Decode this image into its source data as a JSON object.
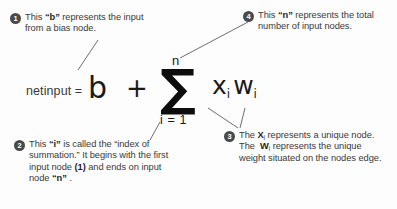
{
  "diagram": {
    "background_color": "#fdfdfd",
    "text_color": "#3a3a3a",
    "badge_color": "#4a4a4a",
    "formula": {
      "lhs": "netinput =",
      "bias_term": "b",
      "operator": "+",
      "sigma_symbol": "∑",
      "sigma_upper_limit": "n",
      "sigma_lower_limit": "i = 1",
      "summand_x": "x",
      "summand_x_sub": "i",
      "summand_w": "w",
      "summand_w_sub": "i"
    },
    "annotations": [
      {
        "number": "1",
        "line1": "This “b” represents the",
        "line2": "input from a bias node.",
        "target": "bias-term"
      },
      {
        "number": "2",
        "line1": "This “i” is called the “index",
        "line2": "of summation.”  It begins",
        "line3": "with the first input node",
        "line4": "(1) and ends on input",
        "line5": "node “n” .",
        "target": "sigma-lower-limit"
      },
      {
        "number": "3",
        "line1_pre": "The ",
        "line1_x": "X",
        "line1_x_sub": "i",
        "line1_post": " represents a",
        "line2_pre": "unique node. The  ",
        "line2_w": "W",
        "line2_w_sub": "i",
        "line3": "represents the unique",
        "line4": "weight situated on the",
        "line5": "nodes edge.",
        "target": "summand-terms"
      },
      {
        "number": "4",
        "line1": "This “n” represents the",
        "line2": "total number of input",
        "line3": "nodes.",
        "target": "sigma-upper-limit"
      }
    ]
  }
}
